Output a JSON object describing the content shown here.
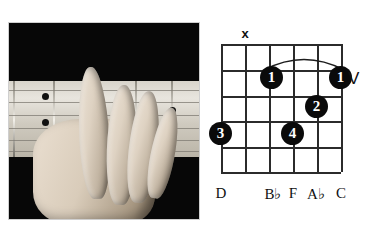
{
  "figure": {
    "kind": "guitar-chord-chart",
    "photo": {
      "alt": "black-and-white photograph of a left hand fingering a barre chord on a guitar fretboard"
    }
  },
  "diagram": {
    "strings": 6,
    "frets": 5,
    "muted_marker": {
      "label": "x",
      "string_index": 1
    },
    "position_marker": {
      "label": "V"
    },
    "barre": {
      "finger": "1",
      "from_string_index": 3,
      "to_string_index": 6,
      "fret": 1
    },
    "dots": [
      {
        "finger": "1",
        "string_index": 3,
        "fret": 1,
        "x": 272,
        "y": 78
      },
      {
        "finger": "1",
        "string_index": 6,
        "fret": 1,
        "x": 341,
        "y": 78
      },
      {
        "finger": "2",
        "string_index": 5,
        "fret": 2,
        "x": 316,
        "y": 107
      },
      {
        "finger": "3",
        "string_index": 1,
        "fret": 3,
        "x": 221,
        "y": 133
      },
      {
        "finger": "4",
        "string_index": 4,
        "fret": 3,
        "x": 292,
        "y": 133
      }
    ],
    "note_labels": [
      {
        "text": "D",
        "root": "D",
        "accidental": "",
        "x": 221
      },
      {
        "text": "B♭",
        "root": "B",
        "accidental": "♭",
        "x": 273
      },
      {
        "text": "F",
        "root": "F",
        "accidental": "",
        "x": 293
      },
      {
        "text": "A♭",
        "root": "A",
        "accidental": "♭",
        "x": 316
      },
      {
        "text": "C",
        "root": "C",
        "accidental": "",
        "x": 341
      }
    ]
  },
  "colors": {
    "ink": "#2b2b2b",
    "dot_fill": "#0a0a0a",
    "dot_text": "#ffffff",
    "page_background": "#ffffff",
    "photo_background": "#0a0a0a"
  }
}
